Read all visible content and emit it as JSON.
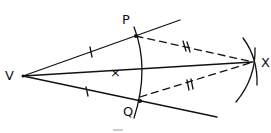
{
  "diagram": {
    "labels": {
      "vertex": "V",
      "point_p": "P",
      "point_q": "Q",
      "point_x": "X"
    },
    "center_mark": "×",
    "colors": {
      "ink": "#111111",
      "background": "#ffffff"
    }
  }
}
